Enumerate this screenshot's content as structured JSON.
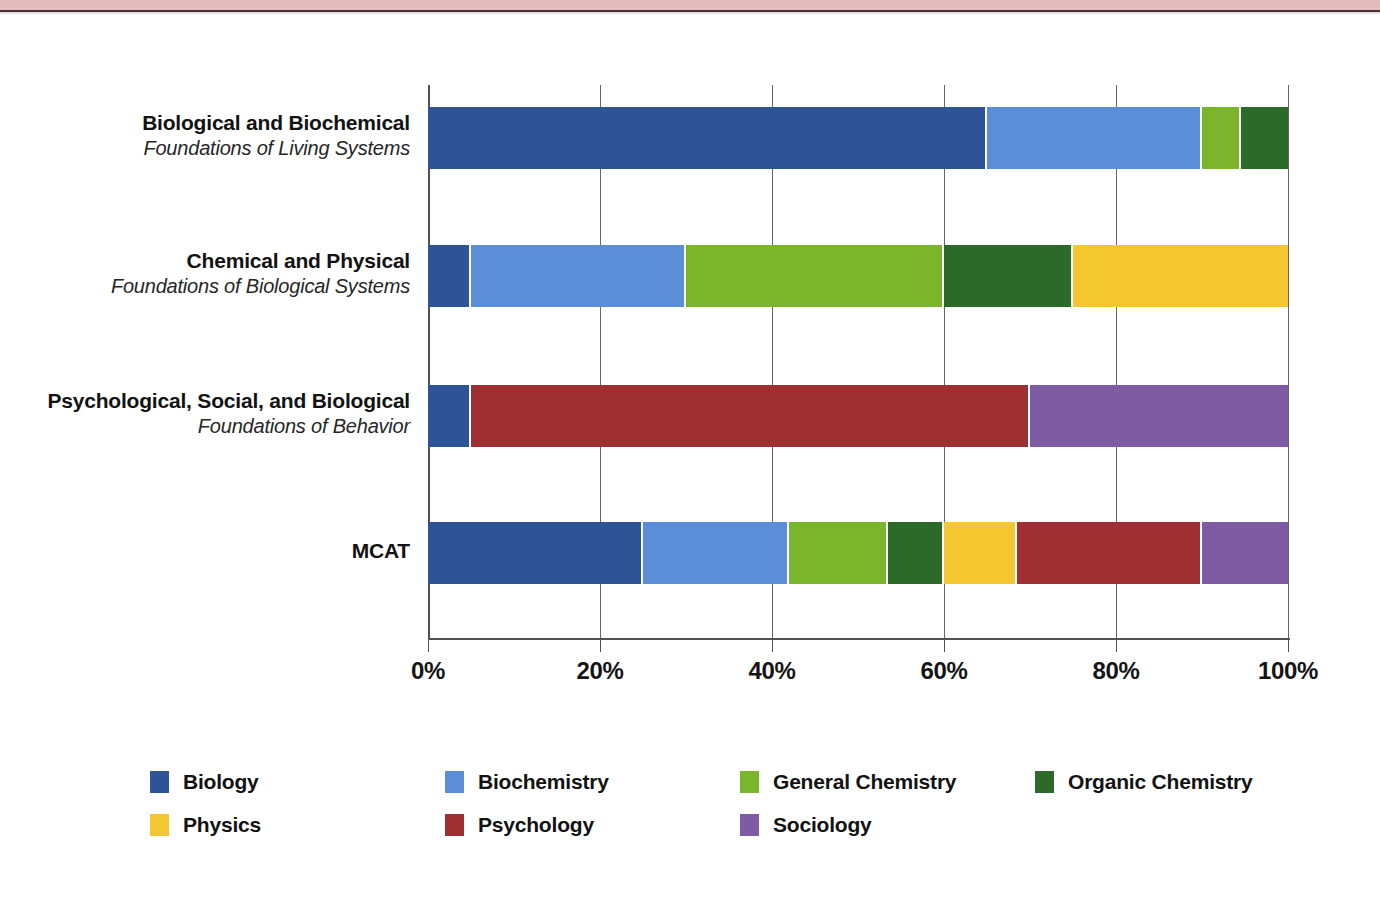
{
  "page": {
    "background_color": "#ffffff",
    "top_band_color": "#e2bcbe",
    "top_band_rule_color": "#4b3034"
  },
  "chart_data": {
    "type": "bar",
    "orientation": "horizontal",
    "stacked": true,
    "normalized": true,
    "title": "",
    "subtitle": "",
    "xlabel": "",
    "ylabel": "",
    "xlim": [
      0,
      100
    ],
    "xtick_labels": [
      "0%",
      "20%",
      "40%",
      "60%",
      "80%",
      "100%"
    ],
    "xticks": [
      0,
      20,
      40,
      60,
      80,
      100
    ],
    "grid": true,
    "legend_position": "bottom",
    "categories": [
      {
        "title": "Biological and Biochemical",
        "subtitle": "Foundations of Living Systems"
      },
      {
        "title": "Chemical and Physical",
        "subtitle": "Foundations of Biological Systems"
      },
      {
        "title": "Psychological, Social, and Biological",
        "subtitle": "Foundations of Behavior"
      },
      {
        "title": "MCAT",
        "subtitle": ""
      }
    ],
    "series": [
      {
        "name": "Biology",
        "color": "#2e5397",
        "values": [
          65,
          5,
          5,
          25
        ]
      },
      {
        "name": "Biochemistry",
        "color": "#5b8ed6",
        "values": [
          25,
          25,
          0,
          17
        ]
      },
      {
        "name": "General Chemistry",
        "color": "#7ab52c",
        "values": [
          4.5,
          30,
          0,
          11.5
        ]
      },
      {
        "name": "Organic Chemistry",
        "color": "#2c6a2a",
        "values": [
          5.5,
          15,
          0,
          6.5
        ]
      },
      {
        "name": "Physics",
        "color": "#f4c731",
        "values": [
          0,
          25,
          0,
          8.5
        ]
      },
      {
        "name": "Psychology",
        "color": "#9e2f33",
        "values": [
          0,
          0,
          65,
          21.5
        ]
      },
      {
        "name": "Sociology",
        "color": "#7e5ba3",
        "values": [
          0,
          0,
          30,
          10
        ]
      }
    ],
    "legend": [
      {
        "label": "Biology",
        "color": "#2e5397"
      },
      {
        "label": "Biochemistry",
        "color": "#5b8ed6"
      },
      {
        "label": "General Chemistry",
        "color": "#7ab52c"
      },
      {
        "label": "Organic Chemistry",
        "color": "#2c6a2a"
      },
      {
        "label": "Physics",
        "color": "#f4c731"
      },
      {
        "label": "Psychology",
        "color": "#9e2f33"
      },
      {
        "label": "Sociology",
        "color": "#7e5ba3"
      }
    ]
  }
}
